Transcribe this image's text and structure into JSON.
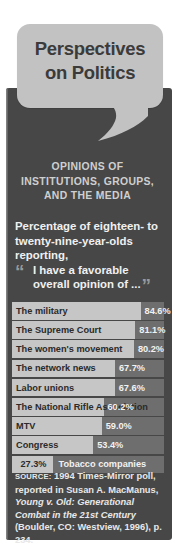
{
  "figure": {
    "title_line_1": "Perspectives",
    "title_line_2": "on Politics",
    "kicker_line_1": "OPINIONS OF",
    "kicker_line_2": "INSTITUTIONS, GROUPS,",
    "kicker_line_3": "AND THE MEDIA",
    "lead_line_1": "Percentage of eighteen- to",
    "lead_line_2": "twenty-nine-year-olds",
    "lead_line_3": "reporting,",
    "quote_text": "I have a favorable overall opinion of ...",
    "open_quote": "“",
    "close_quote": "”"
  },
  "colors": {
    "panel_background": "#474747",
    "bubble": "#c2c2c2",
    "bar_fill": "#c6c6c6",
    "bar_track": "#6e6e6e",
    "title_text": "#3b3b3b",
    "kicker_text": "#cfcfcf"
  },
  "chart_data": {
    "type": "bar",
    "title": "Perspectives on Politics",
    "subtitle": "OPINIONS OF INSTITUTIONS, GROUPS, AND THE MEDIA",
    "xlabel": "",
    "ylabel": "",
    "xlim": [
      0,
      100
    ],
    "grid": false,
    "orientation": "horizontal",
    "value_suffix": "%",
    "categories": [
      "The military",
      "The Supreme Court",
      "The women's movement",
      "The network news",
      "Labor unions",
      "The National Rifle Association",
      "MTV",
      "Congress",
      "Tobacco companies"
    ],
    "values": [
      84.6,
      81.1,
      80.2,
      67.7,
      67.6,
      60.2,
      59.0,
      53.4,
      27.3
    ],
    "value_labels": [
      "84.6%",
      "81.1%",
      "80.2%",
      "67.7%",
      "67.6%",
      "60.2%",
      "59.0%",
      "53.4%",
      "27.3%"
    ],
    "label_placement": [
      "inside",
      "inside",
      "inside",
      "inside",
      "inside",
      "inside",
      "inside",
      "inside",
      "outside"
    ]
  },
  "source": {
    "label": "SOURCE:",
    "text_before_italic": " 1994 Times-Mirror poll, reported in Susan A. MacManus, ",
    "italic_title": "Young v. Old: Generational Combat in the 21st Century",
    "text_after_italic": " (Boulder, CO: Westview, 1996), p. 234."
  }
}
